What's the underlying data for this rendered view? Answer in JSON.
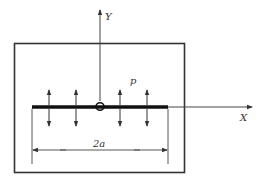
{
  "diagram": {
    "type": "crack-under-pressure",
    "labels": {
      "y_axis": "Y",
      "x_axis": "X",
      "pressure": "p",
      "crack_length": "2a"
    },
    "colors": {
      "line": "#333333",
      "crack": "#111111",
      "background": "#ffffff"
    },
    "pressure_arrow_count": 4
  }
}
